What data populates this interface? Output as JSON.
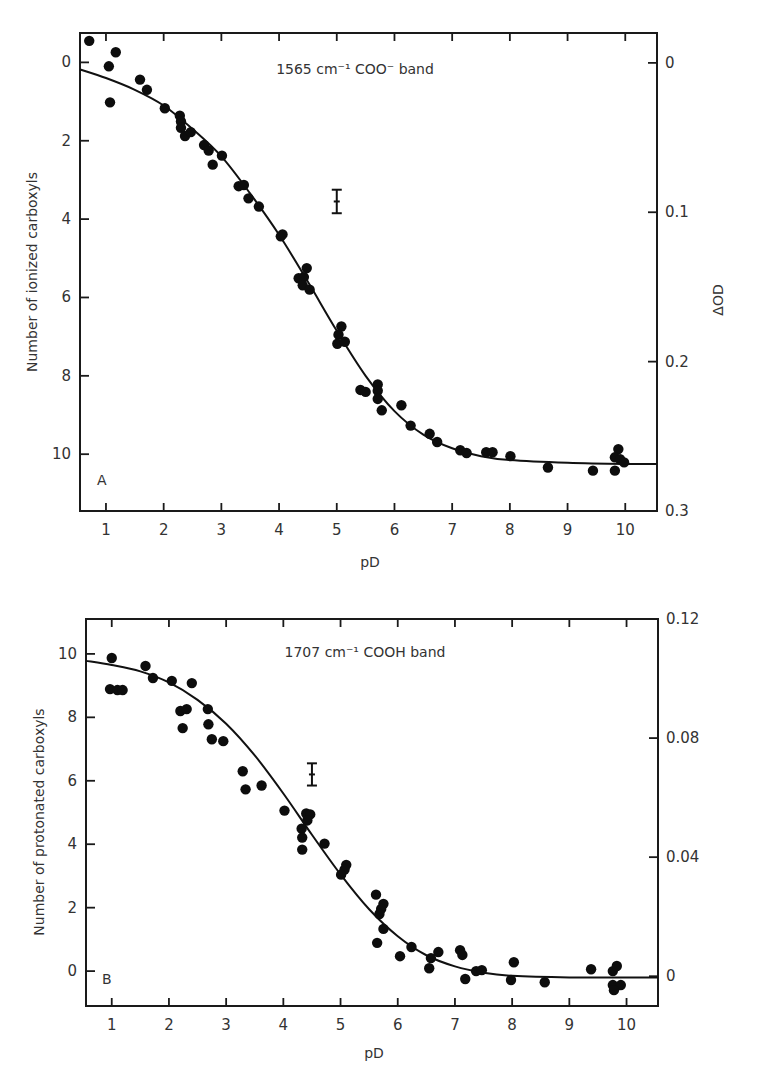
{
  "chart_data": [
    {
      "type": "scatter",
      "panel_label": "A",
      "title": "1565 cm⁻¹ COO⁻ band",
      "xlabel": "pD",
      "ylabel": "Number of ionized carboxyls",
      "y2label": "ΔOD",
      "xlim": [
        0.55,
        10.55
      ],
      "ylim_inverted": [
        -0.75,
        11.45
      ],
      "y2lim_inverted": [
        -0.02,
        0.3
      ],
      "xticks": [
        1,
        2,
        3,
        4,
        5,
        6,
        7,
        8,
        9,
        10
      ],
      "xtick_labels": [
        "1",
        "2",
        "3",
        "4",
        "5",
        "6",
        "7",
        "8",
        "9",
        "10"
      ],
      "yticks": [
        0,
        2,
        4,
        6,
        8,
        10
      ],
      "ytick_labels": [
        "0",
        "2",
        "4",
        "6",
        "8",
        "10"
      ],
      "y2ticks": [
        0,
        0.1,
        0.2,
        0.3
      ],
      "y2tick_labels": [
        "0",
        "0.1",
        "0.2",
        "0.3"
      ],
      "grid": false,
      "error_bar": {
        "x": 5.0,
        "y": 3.55,
        "err": 0.3
      },
      "points": [
        [
          0.71,
          -0.55
        ],
        [
          1.17,
          -0.26
        ],
        [
          1.05,
          0.1
        ],
        [
          1.07,
          1.02
        ],
        [
          1.59,
          0.44
        ],
        [
          1.71,
          0.7
        ],
        [
          2.02,
          1.17
        ],
        [
          2.28,
          1.36
        ],
        [
          2.3,
          1.51
        ],
        [
          2.3,
          1.67
        ],
        [
          2.37,
          1.88
        ],
        [
          2.47,
          1.78
        ],
        [
          2.7,
          2.11
        ],
        [
          2.78,
          2.25
        ],
        [
          3.01,
          2.38
        ],
        [
          2.85,
          2.61
        ],
        [
          3.3,
          3.16
        ],
        [
          3.39,
          3.13
        ],
        [
          3.47,
          3.47
        ],
        [
          3.65,
          3.68
        ],
        [
          4.03,
          4.44
        ],
        [
          4.06,
          4.39
        ],
        [
          4.34,
          5.51
        ],
        [
          4.48,
          5.25
        ],
        [
          4.43,
          5.48
        ],
        [
          4.41,
          5.69
        ],
        [
          4.53,
          5.8
        ],
        [
          5.08,
          6.74
        ],
        [
          5.03,
          6.95
        ],
        [
          5.01,
          7.18
        ],
        [
          5.14,
          7.13
        ],
        [
          5.41,
          8.36
        ],
        [
          5.5,
          8.41
        ],
        [
          5.71,
          8.22
        ],
        [
          5.71,
          8.38
        ],
        [
          5.71,
          8.59
        ],
        [
          5.78,
          8.88
        ],
        [
          6.12,
          8.75
        ],
        [
          6.28,
          9.27
        ],
        [
          6.61,
          9.48
        ],
        [
          6.74,
          9.69
        ],
        [
          7.14,
          9.9
        ],
        [
          7.25,
          9.97
        ],
        [
          7.59,
          9.95
        ],
        [
          7.7,
          9.95
        ],
        [
          8.01,
          10.05
        ],
        [
          8.66,
          10.34
        ],
        [
          9.44,
          10.42
        ],
        [
          9.88,
          9.87
        ],
        [
          9.82,
          10.08
        ],
        [
          9.91,
          10.13
        ],
        [
          9.98,
          10.21
        ],
        [
          9.82,
          10.42
        ]
      ],
      "fit_curve": [
        [
          0.55,
          0.18
        ],
        [
          1.0,
          0.4
        ],
        [
          1.5,
          0.7
        ],
        [
          2.0,
          1.1
        ],
        [
          2.5,
          1.7
        ],
        [
          3.0,
          2.4
        ],
        [
          3.5,
          3.35
        ],
        [
          4.0,
          4.4
        ],
        [
          4.5,
          5.6
        ],
        [
          5.0,
          6.85
        ],
        [
          5.5,
          8.0
        ],
        [
          6.0,
          8.9
        ],
        [
          6.5,
          9.5
        ],
        [
          7.0,
          9.85
        ],
        [
          7.5,
          10.05
        ],
        [
          8.0,
          10.15
        ],
        [
          9.0,
          10.22
        ],
        [
          10.0,
          10.25
        ],
        [
          10.55,
          10.25
        ]
      ]
    },
    {
      "type": "scatter",
      "panel_label": "B",
      "title": "1707 cm⁻¹ COOH band",
      "xlabel": "pD",
      "ylabel": "Number of protonated carboxyls",
      "y2label": "",
      "xlim": [
        0.55,
        10.55
      ],
      "ylim": [
        -1.1,
        11.1
      ],
      "y2lim": [
        -0.01,
        0.12
      ],
      "xticks": [
        1,
        2,
        3,
        4,
        5,
        6,
        7,
        8,
        9,
        10
      ],
      "xtick_labels": [
        "1",
        "2",
        "3",
        "4",
        "5",
        "6",
        "7",
        "8",
        "9",
        "10"
      ],
      "yticks": [
        0,
        2,
        4,
        6,
        8,
        10
      ],
      "ytick_labels": [
        "0",
        "2",
        "4",
        "6",
        "8",
        "10"
      ],
      "y2ticks": [
        0,
        0.04,
        0.08,
        0.12
      ],
      "y2tick_labels": [
        "0",
        "0.04",
        "0.08",
        "0.12"
      ],
      "grid": false,
      "error_bar": {
        "x": 4.5,
        "y": 6.2,
        "err": 0.35
      },
      "points": [
        [
          1.0,
          9.87
        ],
        [
          0.97,
          8.89
        ],
        [
          1.1,
          8.86
        ],
        [
          1.19,
          8.86
        ],
        [
          1.59,
          9.62
        ],
        [
          1.72,
          9.24
        ],
        [
          2.05,
          9.15
        ],
        [
          2.4,
          9.08
        ],
        [
          2.2,
          8.2
        ],
        [
          2.31,
          8.26
        ],
        [
          2.24,
          7.66
        ],
        [
          2.68,
          8.26
        ],
        [
          2.69,
          7.78
        ],
        [
          2.75,
          7.31
        ],
        [
          2.95,
          7.25
        ],
        [
          3.29,
          6.3
        ],
        [
          3.34,
          5.73
        ],
        [
          3.62,
          5.85
        ],
        [
          4.02,
          5.06
        ],
        [
          4.4,
          4.97
        ],
        [
          4.47,
          4.94
        ],
        [
          4.42,
          4.75
        ],
        [
          4.32,
          4.49
        ],
        [
          4.33,
          4.21
        ],
        [
          4.33,
          3.83
        ],
        [
          4.72,
          4.02
        ],
        [
          5.1,
          3.35
        ],
        [
          5.07,
          3.2
        ],
        [
          5.01,
          3.04
        ],
        [
          5.62,
          2.41
        ],
        [
          5.75,
          2.12
        ],
        [
          5.71,
          1.96
        ],
        [
          5.68,
          1.8
        ],
        [
          5.75,
          1.33
        ],
        [
          5.64,
          0.89
        ],
        [
          6.24,
          0.76
        ],
        [
          6.04,
          0.47
        ],
        [
          6.71,
          0.6
        ],
        [
          6.58,
          0.41
        ],
        [
          6.55,
          0.09
        ],
        [
          7.09,
          0.66
        ],
        [
          7.13,
          0.51
        ],
        [
          7.18,
          -0.25
        ],
        [
          7.37,
          0.0
        ],
        [
          7.47,
          0.03
        ],
        [
          8.03,
          0.28
        ],
        [
          7.98,
          -0.28
        ],
        [
          8.57,
          -0.35
        ],
        [
          9.38,
          0.06
        ],
        [
          9.76,
          0.0
        ],
        [
          9.83,
          0.16
        ],
        [
          9.76,
          -0.44
        ],
        [
          9.9,
          -0.44
        ],
        [
          9.78,
          -0.6
        ]
      ],
      "fit_curve": [
        [
          0.55,
          9.78
        ],
        [
          1.0,
          9.65
        ],
        [
          1.5,
          9.45
        ],
        [
          2.0,
          9.1
        ],
        [
          2.5,
          8.55
        ],
        [
          3.0,
          7.8
        ],
        [
          3.5,
          6.8
        ],
        [
          4.0,
          5.6
        ],
        [
          4.5,
          4.3
        ],
        [
          5.0,
          3.05
        ],
        [
          5.5,
          1.95
        ],
        [
          6.0,
          1.1
        ],
        [
          6.5,
          0.5
        ],
        [
          7.0,
          0.15
        ],
        [
          7.5,
          -0.05
        ],
        [
          8.0,
          -0.15
        ],
        [
          9.0,
          -0.2
        ],
        [
          10.0,
          -0.2
        ],
        [
          10.55,
          -0.2
        ]
      ]
    }
  ]
}
